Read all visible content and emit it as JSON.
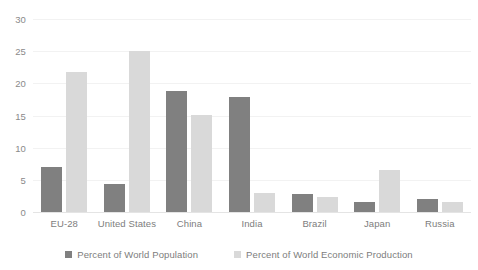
{
  "chart_data": {
    "type": "bar",
    "title": "",
    "subtitle": "",
    "xlabel": "",
    "ylabel": "",
    "categories": [
      "EU-28",
      "United States",
      "China",
      "India",
      "Brazil",
      "Japan",
      "Russia"
    ],
    "series": [
      {
        "name": "Percent of World Population",
        "color": "#808080",
        "values": [
          7.0,
          4.4,
          18.8,
          17.9,
          2.8,
          1.6,
          2.0
        ]
      },
      {
        "name": "Percent of World Economic Production",
        "color": "#d9d9d9",
        "values": [
          21.8,
          25.0,
          15.1,
          3.0,
          2.4,
          6.5,
          1.6
        ]
      }
    ],
    "ylim": [
      0,
      30
    ],
    "y_ticks": [
      0,
      5,
      10,
      15,
      20,
      25,
      30
    ],
    "y_tick_labels": [
      "0",
      "5",
      "10",
      "15",
      "20",
      "25",
      "30"
    ],
    "grid": true,
    "grid_axis": "y",
    "legend_position": "bottom",
    "colors": {
      "gridline": "#f2f2f2",
      "baseline": "#e4e4e4",
      "tick_label": "#7d7d7d",
      "background": "#ffffff"
    }
  }
}
